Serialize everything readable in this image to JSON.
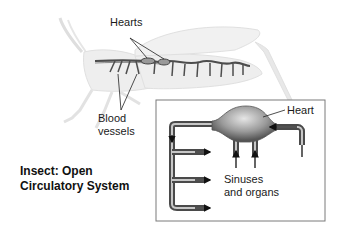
{
  "figure": {
    "title_line1": "Insect: Open",
    "title_line2": "Circulatory System",
    "organism": "grasshopper"
  },
  "labels": {
    "hearts": "Hearts",
    "blood_vessels_line1": "Blood",
    "blood_vessels_line2": "vessels",
    "heart": "Heart",
    "sinuses_line1": "Sinuses",
    "sinuses_line2": "and organs"
  },
  "colors": {
    "body_fill": "#ececec",
    "body_edge": "#dcdcdc",
    "vessel": "#555555",
    "heart_dark": "#6a6a6a",
    "heart_light": "#d8d8d8",
    "inset_border": "#7a7a7a",
    "arrow": "#111111"
  }
}
